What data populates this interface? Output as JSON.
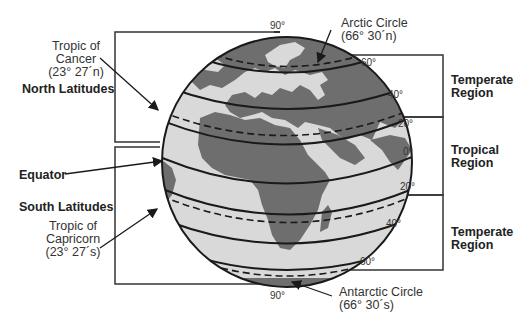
{
  "diagram": {
    "colors": {
      "ocean": "#d9d9d9",
      "land": "#6e6e6e",
      "lines": "#1a1a1a",
      "text": "#333333"
    },
    "left_labels": {
      "tropic_of_cancer": {
        "line1": "Tropic of",
        "line2": "Cancer",
        "line3": "(23° 27´n)"
      },
      "north_latitudes": "North Latitudes",
      "equator": "Equator",
      "south_latitudes": "South Latitudes",
      "tropic_of_capricorn": {
        "line1": "Tropic of",
        "line2": "Capricorn",
        "line3": "(23° 27´s)"
      }
    },
    "top_labels": {
      "north_pole_degree": "90°",
      "arctic_circle": {
        "line1": "Arctic Circle",
        "line2": "(66° 30´n)"
      }
    },
    "bottom_labels": {
      "south_pole_degree": "90°",
      "antarctic_circle": {
        "line1": "Antarctic Circle",
        "line2": "(66° 30´s)"
      }
    },
    "latitude_degrees": {
      "n60": "60°",
      "n40": "40°",
      "n20": "20°",
      "zero": "0°",
      "s20": "20°",
      "s40": "40°",
      "s60": "60°"
    },
    "regions": {
      "temperate_north": {
        "line1": "Temperate",
        "line2": "Region"
      },
      "tropical": {
        "line1": "Tropical",
        "line2": "Region"
      },
      "temperate_south": {
        "line1": "Temperate",
        "line2": "Region"
      }
    }
  }
}
